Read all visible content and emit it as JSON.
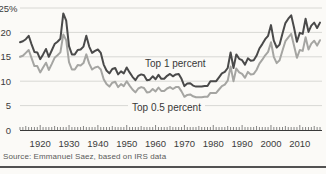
{
  "chart_data": {
    "type": "line",
    "title": "",
    "xlabel": "",
    "ylabel": "",
    "ylim": [
      0,
      25
    ],
    "grid": "horizontal",
    "legend_position": "inline-annotations",
    "years": {
      "start": 1913,
      "end": 2017,
      "step": 1
    },
    "xticks": [
      1920,
      1930,
      1940,
      1950,
      1960,
      1970,
      1980,
      1990,
      2000,
      2010
    ],
    "ytick_values": [
      25,
      20,
      15,
      10,
      5,
      0
    ],
    "ytick_labels": [
      "25%",
      "20",
      "15",
      "10",
      "5",
      "0"
    ],
    "series": [
      {
        "name": "Top 1 percent",
        "color": "#4a4a4a",
        "values": [
          18.0,
          18.2,
          18.6,
          19.3,
          17.6,
          16.0,
          15.9,
          14.5,
          15.5,
          16.6,
          15.0,
          16.3,
          17.6,
          18.1,
          18.7,
          23.9,
          22.4,
          17.2,
          15.5,
          15.5,
          16.4,
          16.5,
          17.1,
          19.3,
          17.1,
          15.8,
          16.2,
          16.5,
          15.8,
          13.4,
          12.2,
          11.6,
          12.5,
          12.7,
          11.4,
          12.0,
          11.6,
          12.8,
          11.8,
          10.9,
          10.2,
          11.1,
          11.4,
          11.2,
          10.2,
          10.3,
          11.0,
          10.4,
          11.3,
          10.5,
          10.5,
          11.1,
          11.5,
          11.0,
          11.4,
          11.5,
          10.5,
          9.0,
          9.5,
          9.6,
          9.1,
          8.9,
          8.9,
          8.9,
          9.0,
          9.0,
          10.0,
          10.0,
          10.0,
          10.8,
          11.6,
          11.9,
          12.7,
          15.9,
          12.7,
          15.5,
          14.6,
          14.3,
          13.4,
          14.7,
          14.2,
          14.3,
          15.2,
          16.7,
          17.6,
          18.6,
          19.3,
          21.5,
          18.3,
          16.9,
          17.5,
          19.8,
          21.9,
          22.8,
          23.5,
          21.0,
          18.1,
          19.9,
          19.7,
          22.8,
          20.1,
          21.4,
          22.0,
          20.9,
          22.0
        ]
      },
      {
        "name": "Top 0.5 percent",
        "color": "#a5a5a2",
        "values": [
          15.0,
          15.2,
          15.8,
          16.4,
          14.8,
          13.1,
          13.1,
          11.8,
          12.8,
          13.8,
          12.3,
          13.5,
          14.8,
          15.3,
          15.9,
          19.6,
          18.4,
          13.9,
          12.4,
          12.4,
          13.3,
          13.2,
          13.7,
          15.5,
          13.6,
          12.4,
          12.8,
          13.0,
          12.4,
          10.4,
          9.4,
          8.9,
          9.7,
          9.9,
          8.8,
          9.4,
          9.0,
          10.0,
          9.1,
          8.3,
          7.7,
          8.5,
          8.8,
          8.6,
          7.7,
          7.8,
          8.4,
          7.9,
          8.7,
          8.0,
          8.0,
          8.5,
          8.8,
          8.4,
          8.8,
          8.8,
          7.9,
          6.8,
          7.2,
          7.3,
          6.9,
          6.7,
          6.7,
          6.7,
          6.8,
          6.8,
          7.6,
          7.6,
          7.6,
          8.3,
          9.0,
          9.3,
          10.1,
          13.0,
          10.0,
          12.6,
          11.8,
          11.5,
          10.7,
          11.9,
          11.4,
          11.5,
          12.3,
          13.6,
          14.4,
          15.3,
          16.0,
          18.0,
          15.0,
          13.7,
          14.3,
          16.3,
          18.2,
          19.0,
          19.7,
          17.3,
          14.8,
          16.4,
          16.2,
          19.0,
          16.5,
          17.7,
          18.3,
          17.3,
          18.4
        ]
      }
    ],
    "annotations": [
      {
        "text": "Top 1 percent"
      },
      {
        "text": "Top 0.5 percent"
      }
    ]
  },
  "source": {
    "text": "Source: Emmanuel Saez, based on IRS data"
  },
  "colors": {
    "background": "#fbfaf7",
    "gridline": "#d8d8d4",
    "axis": "#3a3a3a",
    "series_dark": "#4a4a4a",
    "series_light": "#a5a5a2"
  }
}
